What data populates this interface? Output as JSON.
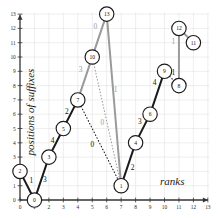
{
  "figure": {
    "title": "",
    "background_color": "#ffffff",
    "grid_color": "#dcdcdc",
    "axis_color": "#333333",
    "dark_edge_color": "#1a1a1a",
    "gray_edge_color": "#9a9a9a",
    "node_fill": "#ffffff",
    "node_stroke": "#1a1a1a"
  },
  "chart_data": {
    "type": "scatter",
    "title": "",
    "xlabel": "ranks",
    "ylabel": "positions of suffixes",
    "xlim": [
      0,
      13
    ],
    "ylim": [
      0,
      13
    ],
    "grid": true,
    "xticks": [
      "0",
      "1",
      "2",
      "3",
      "4",
      "5",
      "6",
      "7",
      "8",
      "9",
      "10",
      "11",
      "12",
      "13"
    ],
    "yticks": [
      "0",
      "1",
      "2",
      "3",
      "4",
      "5",
      "6",
      "7",
      "8",
      "9",
      "10",
      "11",
      "12",
      "13"
    ],
    "nodes": [
      {
        "label": "2",
        "rank": 0,
        "position": 2
      },
      {
        "label": "0",
        "rank": 1,
        "position": 0
      },
      {
        "label": "3",
        "rank": 2,
        "position": 3
      },
      {
        "label": "5",
        "rank": 3,
        "position": 5
      },
      {
        "label": "7",
        "rank": 4,
        "position": 7
      },
      {
        "label": "10",
        "rank": 5,
        "position": 10
      },
      {
        "label": "13",
        "rank": 6,
        "position": 13
      },
      {
        "label": "1",
        "rank": 7,
        "position": 1
      },
      {
        "label": "4",
        "rank": 8,
        "position": 4
      },
      {
        "label": "6",
        "rank": 9,
        "position": 6
      },
      {
        "label": "9",
        "rank": 10,
        "position": 9
      },
      {
        "label": "8",
        "rank": 11,
        "position": 8
      },
      {
        "label": "12",
        "rank": 11,
        "position": 12
      },
      {
        "label": "11",
        "rank": 12,
        "position": 11
      }
    ],
    "edges": [
      {
        "from": "2",
        "to": "0",
        "style": "solid",
        "color": "dark",
        "label": "1",
        "label_rank": 0.78,
        "label_position": 1.35
      },
      {
        "from": "0",
        "to": "3",
        "style": "solid",
        "color": "dark",
        "label": "3",
        "label_rank": 1.72,
        "label_position": 1.4
      },
      {
        "from": "3",
        "to": "5",
        "style": "solid",
        "color": "dark",
        "label": "4",
        "label_rank": 2.25,
        "label_position": 4.15
      },
      {
        "from": "5",
        "to": "7",
        "style": "solid",
        "color": "dark",
        "label": "2",
        "label_rank": 3.25,
        "label_position": 6.2
      },
      {
        "from": "7",
        "to": "10",
        "style": "solid",
        "color": "gray",
        "label": "3",
        "label_rank": 4.2,
        "label_position": 9.1
      },
      {
        "from": "10",
        "to": "13",
        "style": "solid",
        "color": "gray",
        "label": "0",
        "label_rank": 5.22,
        "label_position": 12.15
      },
      {
        "from": "13",
        "to": "1",
        "style": "solid",
        "color": "gray",
        "label": "1",
        "label_rank": 6.62,
        "label_position": 7.7
      },
      {
        "from": "1",
        "to": "4",
        "style": "solid",
        "color": "dark",
        "label": "2",
        "label_rank": 7.8,
        "label_position": 2.25
      },
      {
        "from": "4",
        "to": "6",
        "style": "solid",
        "color": "dark",
        "label": "3",
        "label_rank": 8.3,
        "label_position": 5.5
      },
      {
        "from": "6",
        "to": "9",
        "style": "solid",
        "color": "dark",
        "label": "4",
        "label_rank": 9.32,
        "label_position": 8.25
      },
      {
        "from": "9",
        "to": "8",
        "style": "dotted",
        "color": "dark",
        "label": "1",
        "label_rank": 10.62,
        "label_position": 8.95
      },
      {
        "from": "8",
        "to": "12",
        "style": "solid",
        "color": "gray",
        "label": "1",
        "label_rank": 10.62,
        "label_position": 11.1
      },
      {
        "from": "12",
        "to": "11",
        "style": "solid",
        "color": "gray",
        "label": "2",
        "label_rank": 11.62,
        "label_position": 11.0
      },
      {
        "from": "10",
        "to": "1",
        "style": "dotted",
        "color": "gray",
        "label": "0",
        "label_rank": 5.7,
        "label_position": 5.4
      },
      {
        "from": "7",
        "to": "1",
        "style": "dotted",
        "color": "dark",
        "label": "0",
        "label_rank": 5.0,
        "label_position": 3.9
      }
    ]
  }
}
